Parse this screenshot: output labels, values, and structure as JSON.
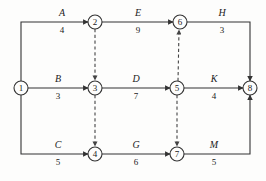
{
  "diagram": {
    "type": "activity-on-arrow-network",
    "colors": {
      "background": "#fdfdfc",
      "stroke": "#333333",
      "text": "#1b1b1b",
      "dashed": "#555555"
    },
    "nodes": [
      {
        "id": "1",
        "label": "1",
        "x": 21,
        "y": 88,
        "r": 7
      },
      {
        "id": "2",
        "label": "2",
        "x": 95,
        "y": 22,
        "r": 7
      },
      {
        "id": "3",
        "label": "3",
        "x": 95,
        "y": 88,
        "r": 7
      },
      {
        "id": "4",
        "label": "4",
        "x": 95,
        "y": 154,
        "r": 7
      },
      {
        "id": "5",
        "label": "5",
        "x": 177,
        "y": 88,
        "r": 7
      },
      {
        "id": "6",
        "label": "6",
        "x": 180,
        "y": 22,
        "r": 7
      },
      {
        "id": "7",
        "label": "7",
        "x": 177,
        "y": 154,
        "r": 7
      },
      {
        "id": "8",
        "label": "8",
        "x": 250,
        "y": 88,
        "r": 7
      }
    ],
    "activities": [
      {
        "id": "A",
        "name": "A",
        "duration": "4",
        "from": "1",
        "to": "2",
        "name_x": 62,
        "name_y": 16,
        "dur_x": 62,
        "dur_y": 33
      },
      {
        "id": "E",
        "name": "E",
        "duration": "9",
        "from": "2",
        "to": "6",
        "name_x": 138,
        "name_y": 16,
        "dur_x": 138,
        "dur_y": 33
      },
      {
        "id": "H",
        "name": "H",
        "duration": "3",
        "from": "6",
        "to": "8",
        "name_x": 222,
        "name_y": 16,
        "dur_x": 222,
        "dur_y": 33
      },
      {
        "id": "B",
        "name": "B",
        "duration": "3",
        "from": "1",
        "to": "3",
        "name_x": 58,
        "name_y": 82,
        "dur_x": 58,
        "dur_y": 99
      },
      {
        "id": "D",
        "name": "D",
        "duration": "7",
        "from": "3",
        "to": "5",
        "name_x": 136,
        "name_y": 82,
        "dur_x": 136,
        "dur_y": 99
      },
      {
        "id": "K",
        "name": "K",
        "duration": "4",
        "from": "5",
        "to": "8",
        "name_x": 214,
        "name_y": 82,
        "dur_x": 214,
        "dur_y": 99
      },
      {
        "id": "C",
        "name": "C",
        "duration": "5",
        "from": "1",
        "to": "4",
        "name_x": 58,
        "name_y": 148,
        "dur_x": 58,
        "dur_y": 165
      },
      {
        "id": "G",
        "name": "G",
        "duration": "6",
        "from": "4",
        "to": "7",
        "name_x": 136,
        "name_y": 148,
        "dur_x": 136,
        "dur_y": 165
      },
      {
        "id": "M",
        "name": "M",
        "duration": "5",
        "from": "7",
        "to": "8",
        "name_x": 214,
        "name_y": 148,
        "dur_x": 214,
        "dur_y": 165
      }
    ],
    "dummy_activities": [
      {
        "id": "dummy-2-3",
        "from": "2",
        "to": "3",
        "direction": "down"
      },
      {
        "id": "dummy-3-4",
        "from": "3",
        "to": "4",
        "direction": "down"
      },
      {
        "id": "dummy-5-6",
        "from": "5",
        "to": "6",
        "direction": "up"
      },
      {
        "id": "dummy-5-7",
        "from": "5",
        "to": "7",
        "direction": "down"
      }
    ]
  }
}
